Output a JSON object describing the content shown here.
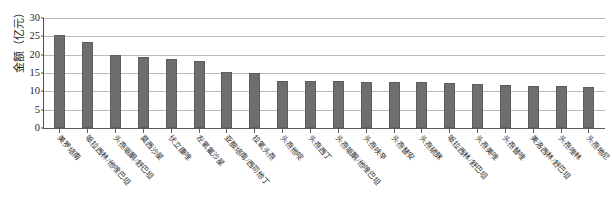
{
  "chart_data": {
    "type": "bar",
    "title": "",
    "xlabel": "",
    "ylabel": "金额（亿元）",
    "ylim": [
      0,
      30
    ],
    "y_ticks": [
      0,
      5,
      10,
      15,
      20,
      25,
      30
    ],
    "y_tick_labels": [
      "0",
      "5",
      "10",
      "15",
      "20",
      "25",
      "30"
    ],
    "grid": true,
    "legend": "none",
    "orientation": "vertical",
    "bar_color": "#6e6e6e",
    "categories": [
      "美罗培南",
      "哌拉西林/他唑巴坦",
      "头孢哌酮/舒巴坦",
      "莫西沙星",
      "伏立康唑",
      "左氧氟沙星",
      "亚胺培南/西司他丁",
      "拉氧头孢",
      "头孢他啶",
      "头孢西丁",
      "头孢哌酮/他唑巴坦",
      "头孢呋辛",
      "头孢替安",
      "头孢硫脒",
      "哌拉西林/舒巴坦",
      "头孢美唑",
      "头孢替唑",
      "美洛西林/舒巴坦",
      "头孢唑林",
      "头孢地尼"
    ],
    "values": [
      25.5,
      23.5,
      19.8,
      19.4,
      18.7,
      18.3,
      15.4,
      14.9,
      12.9,
      12.8,
      12.8,
      12.6,
      12.6,
      12.5,
      12.2,
      12.0,
      11.6,
      11.5,
      11.4,
      11.3
    ]
  }
}
